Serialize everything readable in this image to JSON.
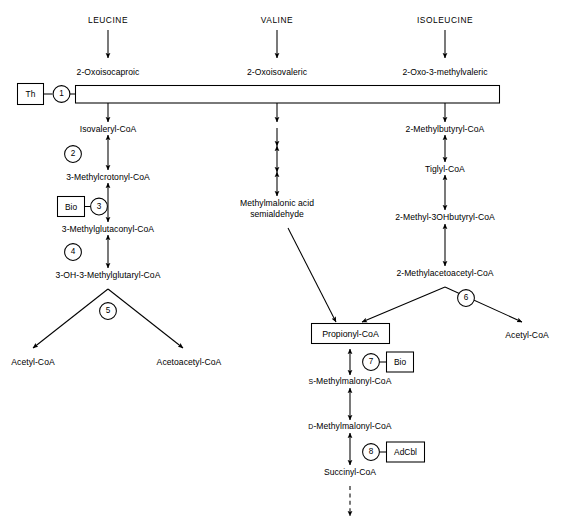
{
  "diagram": {
    "ink_color": "#000000",
    "background_color": "#ffffff"
  },
  "amino_acids": [
    {
      "name": "leucine-input",
      "label": "LEUCINE"
    },
    {
      "name": "valine-input",
      "label": "VALINE"
    },
    {
      "name": "isoleucine-input",
      "label": "ISOLEUCINE"
    }
  ],
  "keto_acids": [
    {
      "name": "oxoisocaproic",
      "label": "2-Oxoisocaproic"
    },
    {
      "name": "oxoisovaleric",
      "label": "2-Oxoisovaleric"
    },
    {
      "name": "oxo-3-methylvaleric",
      "label": "2-Oxo-3-methylvaleric"
    }
  ],
  "leucine_branch": {
    "metabolites": [
      {
        "name": "isovaleryl-coa",
        "label": "Isovaleryl-CoA"
      },
      {
        "name": "3-methylcrotonyl-coa",
        "label": "3-Methylcrotonyl-CoA"
      },
      {
        "name": "3-methylglutaconyl-coa",
        "label": "3-Methylglutaconyl-CoA"
      },
      {
        "name": "3-oh-3-methylglutaryl-coa",
        "label": "3-OH-3-Methylglutaryl-CoA"
      }
    ],
    "products": [
      {
        "name": "acetyl-coa-left",
        "label": "Acetyl-CoA"
      },
      {
        "name": "acetoacetyl-coa",
        "label": "Acetoacetyl-CoA"
      }
    ]
  },
  "valine_branch": {
    "metabolites": [
      {
        "name": "methylmalonic-acid-semialdehyde",
        "label_line1": "Methylmalonic acid",
        "label_line2": "semialdehyde"
      }
    ]
  },
  "isoleucine_branch": {
    "metabolites": [
      {
        "name": "2-methylbutyryl-coa",
        "label": "2-Methylbutyryl-CoA"
      },
      {
        "name": "tiglyl-coa",
        "label": "Tiglyl-CoA"
      },
      {
        "name": "2-methyl-3ohbutyryl-coa",
        "label": "2-Methyl-3OHbutyryl-CoA"
      },
      {
        "name": "2-methylacetoacetyl-coa",
        "label": "2-Methylacetoacetyl-CoA"
      }
    ],
    "products": [
      {
        "name": "acetyl-coa-right",
        "label": "Acetyl-CoA"
      }
    ]
  },
  "common_branch": {
    "metabolites": [
      {
        "name": "propionyl-coa",
        "label": "Propionyl-CoA",
        "boxed": true
      },
      {
        "name": "s-methylmalonyl-coa",
        "prefix": "S",
        "label": "-Methylmalonyl-CoA"
      },
      {
        "name": "d-methylmalonyl-coa",
        "prefix": "D",
        "label": "-Methylmalonyl-CoA"
      },
      {
        "name": "succinyl-coa",
        "label": "Succinyl-CoA"
      }
    ]
  },
  "enzymes": [
    {
      "name": "enzyme-1",
      "number": "1"
    },
    {
      "name": "enzyme-2",
      "number": "2"
    },
    {
      "name": "enzyme-3",
      "number": "3"
    },
    {
      "name": "enzyme-4",
      "number": "4"
    },
    {
      "name": "enzyme-5",
      "number": "5"
    },
    {
      "name": "enzyme-6",
      "number": "6"
    },
    {
      "name": "enzyme-7",
      "number": "7"
    },
    {
      "name": "enzyme-8",
      "number": "8"
    }
  ],
  "cofactors": [
    {
      "name": "cofactor-thiamine",
      "label": "Th",
      "enzyme": "1"
    },
    {
      "name": "cofactor-biotin-3",
      "label": "Bio",
      "enzyme": "3"
    },
    {
      "name": "cofactor-biotin-7",
      "label": "Bio",
      "enzyme": "7"
    },
    {
      "name": "cofactor-adcbl-8",
      "label": "AdCbl",
      "enzyme": "8"
    }
  ]
}
